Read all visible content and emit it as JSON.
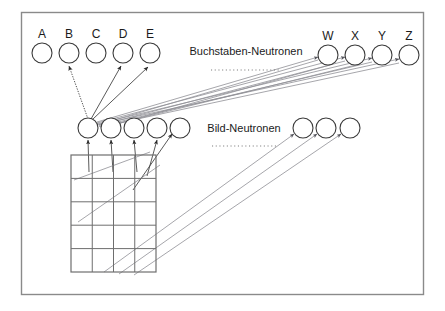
{
  "figure": {
    "background": "#ffffff",
    "frame_color": "#8a8a8a",
    "node_stroke": "#3a3a3a",
    "connection_color": "#3c3c3c",
    "grid_color": "#6e6e6e"
  },
  "letter_layer": {
    "group_label": "Buchstaben-Neutronen",
    "left_nodes": [
      {
        "label": "A",
        "cx": 42,
        "cy": 53,
        "r": 10
      },
      {
        "label": "B",
        "cx": 69,
        "cy": 53,
        "r": 10
      },
      {
        "label": "C",
        "cx": 96,
        "cy": 53,
        "r": 10
      },
      {
        "label": "D",
        "cx": 123,
        "cy": 53,
        "r": 10
      },
      {
        "label": "E",
        "cx": 150,
        "cy": 53,
        "r": 10
      }
    ],
    "right_nodes": [
      {
        "label": "W",
        "cx": 328,
        "cy": 55,
        "r": 10
      },
      {
        "label": "X",
        "cx": 355,
        "cy": 55,
        "r": 10
      },
      {
        "label": "Y",
        "cx": 382,
        "cy": 55,
        "r": 10
      },
      {
        "label": "Z",
        "cx": 409,
        "cy": 55,
        "r": 10
      }
    ],
    "label_x": 246,
    "label_y": 51,
    "separator": {
      "x1": 211,
      "x2": 281,
      "y": 70
    }
  },
  "image_layer": {
    "group_label": "Bild-Neutronen",
    "left_nodes": [
      {
        "cx": 88,
        "cy": 128,
        "r": 10
      },
      {
        "cx": 111,
        "cy": 128,
        "r": 10
      },
      {
        "cx": 134,
        "cy": 128,
        "r": 10
      },
      {
        "cx": 157,
        "cy": 128,
        "r": 10
      },
      {
        "cx": 180,
        "cy": 128,
        "r": 10
      }
    ],
    "right_nodes": [
      {
        "cx": 303,
        "cy": 128,
        "r": 10
      },
      {
        "cx": 326,
        "cy": 128,
        "r": 10
      },
      {
        "cx": 350,
        "cy": 128,
        "r": 10
      }
    ],
    "label_x": 244,
    "label_y": 128,
    "separator": {
      "x1": 212,
      "x2": 278,
      "y": 146
    }
  },
  "retina_grid": {
    "x": 71,
    "y": 155,
    "width": 85,
    "height": 117,
    "columns": 4,
    "rows": 5
  },
  "connections": {
    "hub_node": {
      "cx": 88,
      "cy": 128
    },
    "to_letters": [
      {
        "target": "B",
        "style": "dotted"
      },
      {
        "target": "D",
        "style": "solid"
      },
      {
        "target": "E",
        "style": "solid"
      }
    ],
    "to_right_letters": [
      "W",
      "X",
      "Y",
      "Z"
    ],
    "bundle_line_count": 9,
    "grid_to_image_nodes": 4,
    "grid_to_right_nodes": 3
  }
}
